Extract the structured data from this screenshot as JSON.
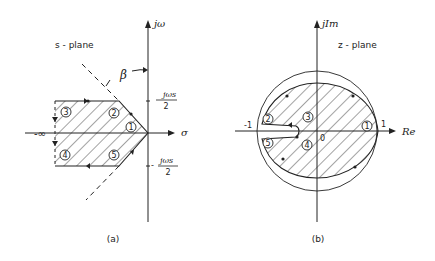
{
  "panel_a": {
    "caption": "(a)",
    "plane_label": "s - plane",
    "y_axis_label": "jω",
    "x_axis_label": "σ",
    "angle_label": "β",
    "neg_infinity_label": "-∞",
    "upper_tick_num": "jωs",
    "upper_tick_den": "2",
    "lower_tick_sign": "-",
    "lower_tick_num": "jωs",
    "lower_tick_den": "2",
    "region_points": [
      "1",
      "2",
      "3",
      "4",
      "5"
    ]
  },
  "panel_b": {
    "caption": "(b)",
    "plane_label": "z - plane",
    "y_axis_label": "jIm",
    "x_axis_label": "Re",
    "neg_one_label": "-1",
    "pos_one_label": "1",
    "origin_label": "0",
    "region_points": [
      "1",
      "2",
      "3",
      "4",
      "5"
    ]
  },
  "colors": {
    "line": "#222222",
    "background": "#ffffff"
  }
}
